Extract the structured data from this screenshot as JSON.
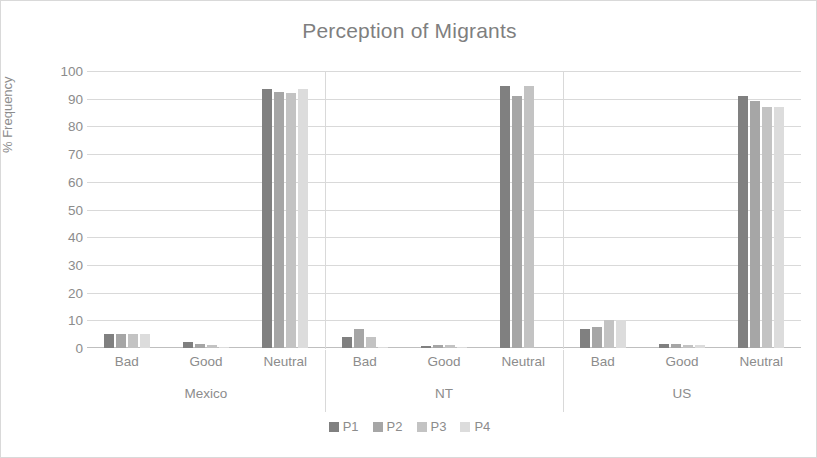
{
  "chart_data": {
    "type": "bar",
    "title": "Perception of Migrants",
    "xlabel": "",
    "ylabel": "% Frequency",
    "ylim": [
      0,
      100
    ],
    "ytick_step": 10,
    "yticks": [
      100,
      90,
      80,
      70,
      60,
      50,
      40,
      30,
      20,
      10,
      0
    ],
    "grid": true,
    "legend_position": "bottom",
    "groups": [
      "Mexico",
      "NT",
      "US"
    ],
    "categories": [
      "Bad",
      "Good",
      "Neutral"
    ],
    "series": [
      {
        "name": "P1",
        "color": "#808080",
        "values": {
          "Mexico": {
            "Bad": 5,
            "Good": 2,
            "Neutral": 93.5
          },
          "NT": {
            "Bad": 4,
            "Good": 0.8,
            "Neutral": 94.5
          },
          "US": {
            "Bad": 7,
            "Good": 1.5,
            "Neutral": 91
          }
        }
      },
      {
        "name": "P2",
        "color": "#a6a6a6",
        "values": {
          "Mexico": {
            "Bad": 5,
            "Good": 1.5,
            "Neutral": 92.5
          },
          "NT": {
            "Bad": 7,
            "Good": 1,
            "Neutral": 91
          },
          "US": {
            "Bad": 7.5,
            "Good": 1.5,
            "Neutral": 89
          }
        }
      },
      {
        "name": "P3",
        "color": "#c3c3c3",
        "values": {
          "Mexico": {
            "Bad": 5,
            "Good": 1,
            "Neutral": 92
          },
          "NT": {
            "Bad": 4,
            "Good": 1,
            "Neutral": 94.5
          },
          "US": {
            "Bad": 10,
            "Good": 1,
            "Neutral": 87
          }
        }
      },
      {
        "name": "P4",
        "color": "#dcdcdc",
        "values": {
          "Mexico": {
            "Bad": 5,
            "Good": 0.5,
            "Neutral": 93.5
          },
          "NT": {
            "Bad": 0.5,
            "Good": 0.5,
            "Neutral": 0
          },
          "US": {
            "Bad": 10,
            "Good": 1,
            "Neutral": 87
          }
        }
      }
    ]
  },
  "axis": {
    "y_label": "% Frequency"
  },
  "legend": {
    "items": [
      {
        "label": "P1",
        "color": "#808080"
      },
      {
        "label": "P2",
        "color": "#a6a6a6"
      },
      {
        "label": "P3",
        "color": "#c3c3c3"
      },
      {
        "label": "P4",
        "color": "#dcdcdc"
      }
    ]
  }
}
